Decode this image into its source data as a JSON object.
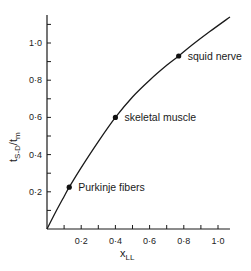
{
  "chart_data": {
    "type": "line",
    "title": "",
    "xlabel": "x",
    "xlabel_sub": "LL",
    "ylabel_main": "t",
    "ylabel_sub1": "S-D",
    "ylabel_mid": "/t",
    "ylabel_sub2": "m",
    "xlim": [
      0,
      1.07
    ],
    "ylim": [
      0,
      1.14
    ],
    "x_ticks": [
      0.1,
      0.2,
      0.3,
      0.4,
      0.5,
      0.6,
      0.7,
      0.8,
      0.9,
      1.0
    ],
    "x_tick_labels": [
      {
        "value": 0.2,
        "label": "0·2"
      },
      {
        "value": 0.4,
        "label": "0·4"
      },
      {
        "value": 0.6,
        "label": "0·6"
      },
      {
        "value": 0.8,
        "label": "0·8"
      },
      {
        "value": 1.0,
        "label": "1·0"
      }
    ],
    "y_ticks": [
      0.1,
      0.2,
      0.3,
      0.4,
      0.5,
      0.6,
      0.7,
      0.8,
      0.9,
      1.0,
      1.1
    ],
    "y_tick_labels": [
      {
        "value": 0.2,
        "label": "0·2"
      },
      {
        "value": 0.4,
        "label": "0·4"
      },
      {
        "value": 0.6,
        "label": "0·6"
      },
      {
        "value": 0.8,
        "label": "0·8"
      },
      {
        "value": 1.0,
        "label": "1·0"
      }
    ],
    "grid": false,
    "series": [
      {
        "name": "curve",
        "x": [
          0,
          0.05,
          0.1,
          0.13,
          0.2,
          0.3,
          0.4,
          0.5,
          0.6,
          0.7,
          0.77,
          0.85,
          0.95,
          1.07
        ],
        "y": [
          0,
          0.09,
          0.175,
          0.225,
          0.33,
          0.47,
          0.6,
          0.71,
          0.8,
          0.88,
          0.93,
          0.99,
          1.06,
          1.14
        ]
      }
    ],
    "points": [
      {
        "name": "Purkinje fibers",
        "x": 0.13,
        "y": 0.225
      },
      {
        "name": "skeletal muscle",
        "x": 0.4,
        "y": 0.6
      },
      {
        "name": "squid nerve",
        "x": 0.77,
        "y": 0.93
      }
    ]
  }
}
